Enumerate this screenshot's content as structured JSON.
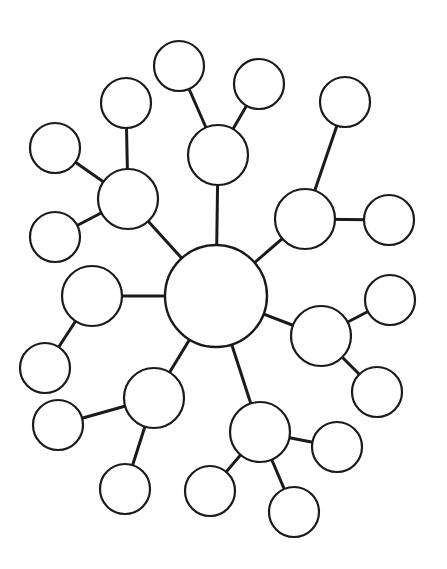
{
  "diagram": {
    "type": "bubble-map",
    "title": "",
    "colors": {
      "stroke": "#1a1a1a",
      "fill": "#ffffff",
      "background": "#ffffff"
    },
    "center": {
      "id": "center",
      "cx": 216,
      "cy": 296,
      "r": 51,
      "label": ""
    },
    "branches": [
      {
        "id": "hub-left",
        "cx": 92,
        "cy": 296,
        "r": 30,
        "label": "",
        "leaves": [
          {
            "id": "leaf-left-1",
            "cx": 45,
            "cy": 368,
            "r": 25,
            "label": ""
          }
        ]
      },
      {
        "id": "hub-top-left",
        "cx": 128,
        "cy": 199,
        "r": 30,
        "label": "",
        "leaves": [
          {
            "id": "leaf-top-left-1",
            "cx": 55,
            "cy": 148,
            "r": 25,
            "label": ""
          },
          {
            "id": "leaf-top-left-2",
            "cx": 55,
            "cy": 237,
            "r": 25,
            "label": ""
          },
          {
            "id": "leaf-top-left-3",
            "cx": 126,
            "cy": 103,
            "r": 25,
            "label": ""
          }
        ]
      },
      {
        "id": "hub-top",
        "cx": 218,
        "cy": 155,
        "r": 30,
        "label": "",
        "leaves": [
          {
            "id": "leaf-top-1",
            "cx": 179,
            "cy": 66,
            "r": 25,
            "label": ""
          },
          {
            "id": "leaf-top-2",
            "cx": 259,
            "cy": 84,
            "r": 25,
            "label": ""
          }
        ]
      },
      {
        "id": "hub-top-right",
        "cx": 305,
        "cy": 219,
        "r": 30,
        "label": "",
        "leaves": [
          {
            "id": "leaf-top-right-1",
            "cx": 345,
            "cy": 102,
            "r": 25,
            "label": ""
          },
          {
            "id": "leaf-top-right-2",
            "cx": 389,
            "cy": 220,
            "r": 25,
            "label": ""
          }
        ]
      },
      {
        "id": "hub-right",
        "cx": 321,
        "cy": 336,
        "r": 30,
        "label": "",
        "leaves": [
          {
            "id": "leaf-right-1",
            "cx": 390,
            "cy": 300,
            "r": 25,
            "label": ""
          },
          {
            "id": "leaf-right-2",
            "cx": 377,
            "cy": 392,
            "r": 25,
            "label": ""
          }
        ]
      },
      {
        "id": "hub-bottom-left",
        "cx": 154,
        "cy": 398,
        "r": 30,
        "label": "",
        "leaves": [
          {
            "id": "leaf-bottom-left-1",
            "cx": 58,
            "cy": 425,
            "r": 25,
            "label": ""
          },
          {
            "id": "leaf-bottom-left-2",
            "cx": 125,
            "cy": 489,
            "r": 25,
            "label": ""
          }
        ]
      },
      {
        "id": "hub-bottom-right",
        "cx": 260,
        "cy": 432,
        "r": 30,
        "label": "",
        "leaves": [
          {
            "id": "leaf-bottom-right-1",
            "cx": 337,
            "cy": 447,
            "r": 25,
            "label": ""
          },
          {
            "id": "leaf-bottom-right-2",
            "cx": 294,
            "cy": 512,
            "r": 25,
            "label": ""
          },
          {
            "id": "leaf-bottom-right-3",
            "cx": 210,
            "cy": 491,
            "r": 25,
            "label": ""
          }
        ]
      }
    ]
  }
}
